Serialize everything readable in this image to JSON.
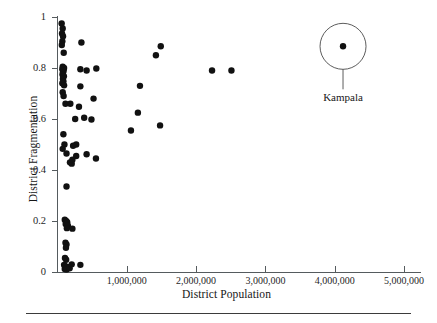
{
  "figure": {
    "background_color": "#ffffff",
    "point_color": "#111111",
    "axis_color": "#555b5e"
  },
  "axes": {
    "x_title": "District Population",
    "y_title": "District Fragmentation",
    "x_ticks": [
      "1,000,000",
      "2,000,000",
      "3,000,000",
      "4,000,000",
      "5,000,000"
    ],
    "x_tick_values": [
      1000000,
      2000000,
      3000000,
      4000000,
      5000000
    ],
    "y_ticks": [
      "0",
      "0.2",
      "0.4",
      "0.6",
      "0.8",
      "1"
    ],
    "y_tick_values": [
      0,
      0.2,
      0.4,
      0.6,
      0.8,
      1
    ]
  },
  "annotation": {
    "label": "Kampala",
    "circle_center": [
      4120000,
      0.885
    ],
    "circle_radius_px": 23
  },
  "chart_data": {
    "type": "scatter",
    "title": "",
    "xlabel": "District Population",
    "ylabel": "District Fragmentation",
    "xlim": [
      0,
      5250000
    ],
    "ylim": [
      -0.02,
      1.02
    ],
    "grid": false,
    "legend": "none",
    "marker_size_px": 4.2,
    "annotations": [
      {
        "text": "Kampala",
        "x": 4120000,
        "y": 0.885,
        "style": "circled-callout"
      }
    ],
    "series": [
      {
        "name": "Districts",
        "color": "#111111",
        "points": [
          [
            60000,
            0.975
          ],
          [
            75000,
            0.955
          ],
          [
            65000,
            0.935
          ],
          [
            80000,
            0.925
          ],
          [
            70000,
            0.905
          ],
          [
            62000,
            0.89
          ],
          [
            90000,
            0.86
          ],
          [
            345000,
            0.9
          ],
          [
            75000,
            0.805
          ],
          [
            95000,
            0.8
          ],
          [
            70000,
            0.795
          ],
          [
            88000,
            0.79
          ],
          [
            80000,
            0.783
          ],
          [
            72000,
            0.775
          ],
          [
            92000,
            0.768
          ],
          [
            78000,
            0.758
          ],
          [
            85000,
            0.748
          ],
          [
            70000,
            0.74
          ],
          [
            95000,
            0.732
          ],
          [
            330000,
            0.795
          ],
          [
            420000,
            0.79
          ],
          [
            560000,
            0.798
          ],
          [
            1420000,
            0.85
          ],
          [
            1490000,
            0.885
          ],
          [
            2230000,
            0.79
          ],
          [
            2510000,
            0.79
          ],
          [
            75000,
            0.705
          ],
          [
            88000,
            0.69
          ],
          [
            115000,
            0.66
          ],
          [
            185000,
            0.66
          ],
          [
            330000,
            0.728
          ],
          [
            520000,
            0.68
          ],
          [
            1190000,
            0.73
          ],
          [
            310000,
            0.648
          ],
          [
            1160000,
            0.625
          ],
          [
            255000,
            0.6
          ],
          [
            385000,
            0.605
          ],
          [
            490000,
            0.598
          ],
          [
            1060000,
            0.555
          ],
          [
            1480000,
            0.575
          ],
          [
            85000,
            0.54
          ],
          [
            100000,
            0.5
          ],
          [
            270000,
            0.5
          ],
          [
            75000,
            0.483
          ],
          [
            225000,
            0.495
          ],
          [
            130000,
            0.465
          ],
          [
            270000,
            0.455
          ],
          [
            420000,
            0.462
          ],
          [
            180000,
            0.43
          ],
          [
            205000,
            0.425
          ],
          [
            215000,
            0.44
          ],
          [
            555000,
            0.445
          ],
          [
            130000,
            0.335
          ],
          [
            105000,
            0.205
          ],
          [
            125000,
            0.2
          ],
          [
            140000,
            0.195
          ],
          [
            118000,
            0.188
          ],
          [
            150000,
            0.182
          ],
          [
            135000,
            0.172
          ],
          [
            215000,
            0.17
          ],
          [
            115000,
            0.115
          ],
          [
            130000,
            0.108
          ],
          [
            122000,
            0.095
          ],
          [
            108000,
            0.055
          ],
          [
            125000,
            0.048
          ],
          [
            95000,
            0.028
          ],
          [
            118000,
            0.022
          ],
          [
            140000,
            0.02
          ],
          [
            160000,
            0.018
          ],
          [
            105000,
            0.012
          ],
          [
            130000,
            0.01
          ],
          [
            175000,
            0.015
          ],
          [
            205000,
            0.03
          ],
          [
            330000,
            0.028
          ],
          [
            4120000,
            0.885
          ]
        ]
      }
    ]
  }
}
